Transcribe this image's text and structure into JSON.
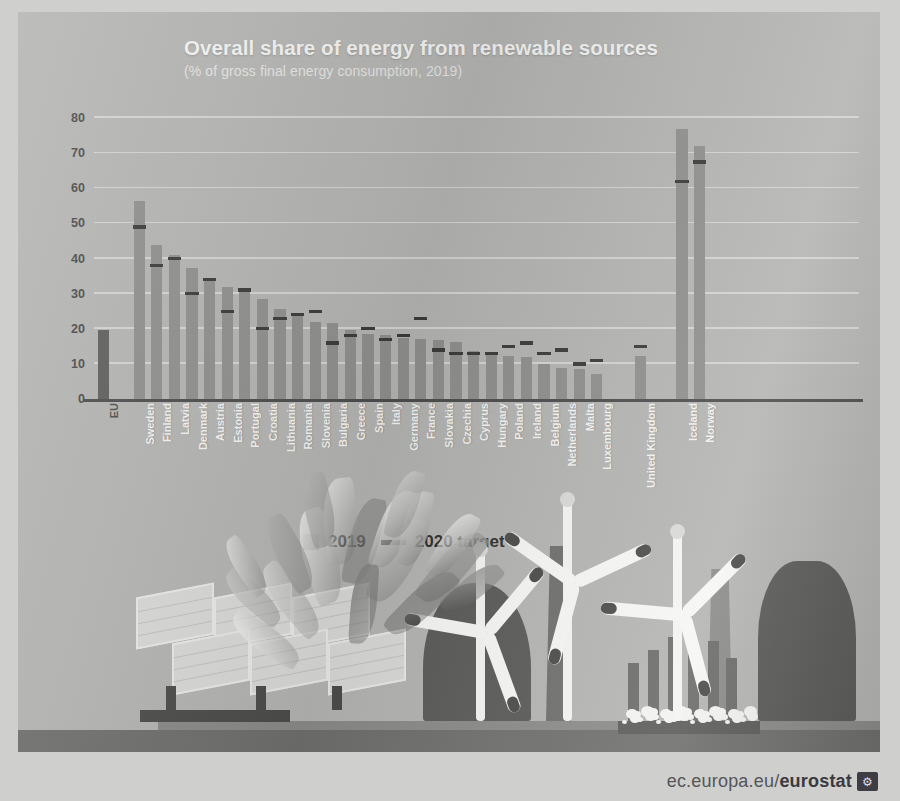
{
  "header": {
    "title": "Overall share of energy from renewable sources",
    "subtitle": "(% of gross final energy consumption, 2019)"
  },
  "legend": {
    "series_label": "2019",
    "target_label": "2020 target"
  },
  "footer": {
    "url_prefix": "ec.europa.eu/",
    "url_brand": "eurostat",
    "glyph": "⚙"
  },
  "colors": {
    "background": "#b4b4b2",
    "bar": "#8f8f8d",
    "bar_eu": "#5e5e5c",
    "target": "#3b3b39",
    "gridline": "#d8d8d6",
    "axis": "#4d4d4d",
    "title_text": "#f2f2f0"
  },
  "chart_data": {
    "type": "bar",
    "title": "Overall share of energy from renewable sources",
    "subtitle": "(% of gross final energy consumption, 2019)",
    "xlabel": "",
    "ylabel": "% of gross final energy consumption",
    "ylim": [
      0,
      80
    ],
    "yticks": [
      0,
      10,
      20,
      30,
      40,
      50,
      60,
      70,
      80
    ],
    "grid": true,
    "legend_position": "below-plot-left",
    "categories": [
      "EU",
      "Sweden",
      "Finland",
      "Latvia",
      "Denmark",
      "Austria",
      "Estonia",
      "Portugal",
      "Croatia",
      "Lithuania",
      "Romania",
      "Slovenia",
      "Bulgaria",
      "Greece",
      "Spain",
      "Italy",
      "Germany",
      "France",
      "Slovakia",
      "Czechia",
      "Cyprus",
      "Hungary",
      "Poland",
      "Ireland",
      "Belgium",
      "Netherlands",
      "Malta",
      "Luxembourg",
      "United Kingdom",
      "Iceland",
      "Norway"
    ],
    "series": [
      {
        "name": "2019",
        "values": [
          19.7,
          56.4,
          43.8,
          41.0,
          37.2,
          33.6,
          31.9,
          30.6,
          28.5,
          25.5,
          24.3,
          21.9,
          21.6,
          19.7,
          18.4,
          18.2,
          17.4,
          17.2,
          16.9,
          16.2,
          13.8,
          12.6,
          12.2,
          12.0,
          9.9,
          8.8,
          8.5,
          7.0,
          12.3,
          76.8,
          72.0
        ]
      },
      {
        "name": "2020 target",
        "values": [
          null,
          49.0,
          38.0,
          40.0,
          30.0,
          34.0,
          25.0,
          31.0,
          20.0,
          23.0,
          24.0,
          25.0,
          16.0,
          18.0,
          20.0,
          17.0,
          18.0,
          23.0,
          14.0,
          13.0,
          13.0,
          13.0,
          15.0,
          16.0,
          13.0,
          14.0,
          10.0,
          11.0,
          15.0,
          62.0,
          67.5
        ]
      }
    ]
  },
  "illustration": {
    "elements": [
      "solar-panels",
      "biomass-leaves",
      "cooling-tower",
      "smokestack",
      "wind-turbine",
      "wind-turbine",
      "wind-turbine",
      "rods",
      "water-foam"
    ]
  }
}
